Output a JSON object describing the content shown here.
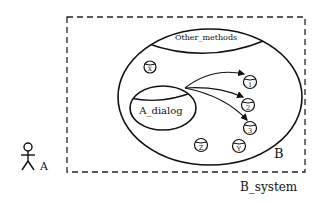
{
  "diagram": {
    "system_label": "B_system",
    "component_label": "B",
    "actor_label": "A",
    "other_methods_label": "Other_methods",
    "dialog_label": "A_dialog",
    "nodes": {
      "x": "X",
      "one": "1",
      "two": "2",
      "three": "3",
      "z": "Z",
      "y": "Y"
    },
    "edges": [
      {
        "from": "A_dialog",
        "to": "1"
      },
      {
        "from": "A_dialog",
        "to": "2"
      },
      {
        "from": "A_dialog",
        "to": "3"
      }
    ],
    "colors": {
      "stroke": "#111111",
      "background": "#ffffff"
    }
  }
}
